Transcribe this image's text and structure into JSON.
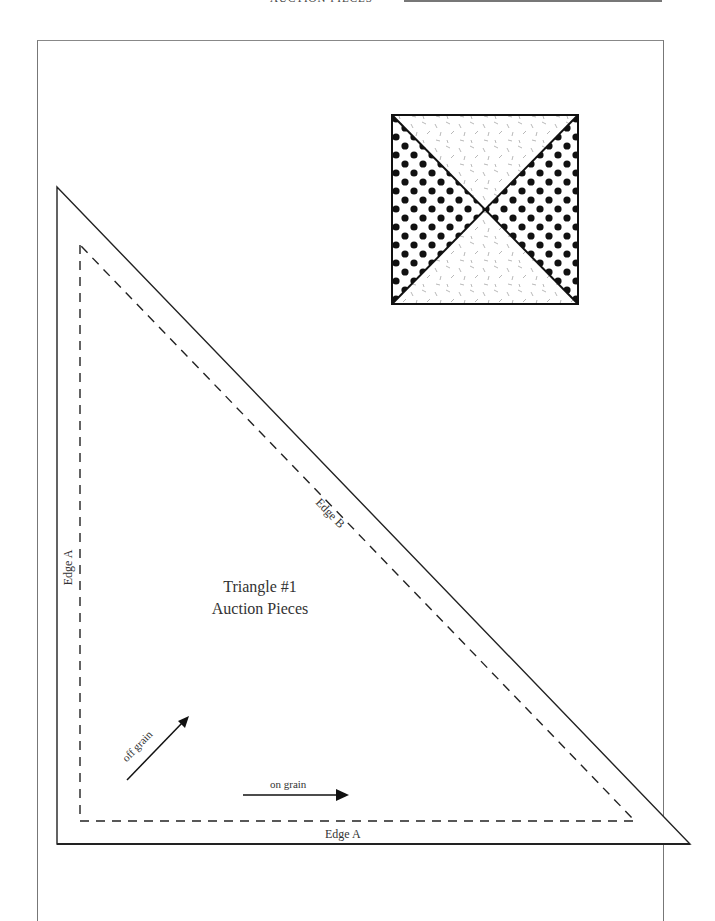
{
  "header": {
    "running_title": "AUCTION PIECES"
  },
  "block_preview": {
    "description": "quarter-square triangle block",
    "fabric_left_right": "dark dotted",
    "fabric_top_bottom": "light speckled"
  },
  "template": {
    "title": "Triangle #1",
    "subtitle": "Auction Pieces",
    "edge_left": "Edge A",
    "edge_bottom": "Edge A",
    "edge_hypotenuse": "Edge B",
    "grain_on": "on grain",
    "grain_off": "off grain"
  },
  "colors": {
    "line": "#222222",
    "frame": "#777777",
    "dot": "#111111",
    "speckle": "#999999"
  }
}
